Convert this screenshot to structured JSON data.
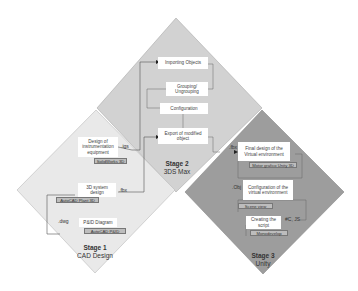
{
  "colors": {
    "stage1_fill": "#e9e9e9",
    "stage2_fill": "#d2d2d2",
    "stage3_fill": "#9d9d9d",
    "tool_fill": "#bdbdbd",
    "arrow": "#333333"
  },
  "stage1": {
    "title": "Stage 1",
    "subtitle": "CAD Design",
    "boxes": {
      "instrumentation": "Design of instrumentation equipment",
      "system3d": "3D system design",
      "pid": "P&ID Diagram"
    },
    "tools": {
      "solidworks": "SolidWorks 3D",
      "plant3d": "AutoCAD Plant 3D",
      "autocad_pid": "AutoCAD P&ID"
    },
    "formats": {
      "igs": ".igs",
      "fbx": ".fbx",
      "dwg": ".dwg"
    }
  },
  "stage2": {
    "title": "Stage 2",
    "subtitle": "3DS Max",
    "boxes": {
      "importing": "Importing Objects",
      "grouping": "Grouping/ Ungrouping",
      "configuration": "Configuration",
      "export": "Export of modified object"
    }
  },
  "stage3": {
    "title": "Stage 3",
    "subtitle": "Unity",
    "boxes": {
      "final_design": "Final design of the Virtual environment",
      "configuration": "Configuration of the virtual environment",
      "script": "Creating the script"
    },
    "tools": {
      "motor": "Motor grafico Unity 3D",
      "scene": "Scene view",
      "mono": "Monodevelop"
    },
    "formats": {
      "fbx": ".fbx",
      "obj": ".Obj",
      "cs_js": "#C, JS"
    }
  }
}
